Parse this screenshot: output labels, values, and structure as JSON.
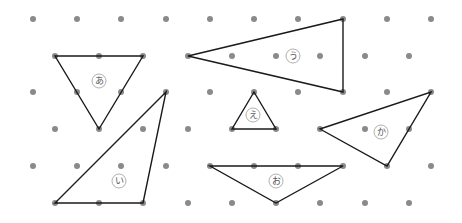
{
  "diagram": {
    "type": "triangular-dot-grid",
    "width": 462,
    "height": 223,
    "colors": {
      "dot": "#8a8a8a",
      "line": "#1a1a1a",
      "label_circle": "#9a9a9a",
      "label_text": "#555555"
    },
    "grid": {
      "rows": [
        {
          "y": 19,
          "xs": [
            33,
            77,
            121,
            166,
            210,
            254,
            298,
            343,
            387,
            431
          ]
        },
        {
          "y": 56,
          "xs": [
            55,
            99,
            143,
            188,
            232,
            276,
            320,
            365,
            409
          ]
        },
        {
          "y": 92,
          "xs": [
            33,
            77,
            121,
            166,
            210,
            254,
            298,
            343,
            387,
            431
          ]
        },
        {
          "y": 129,
          "xs": [
            55,
            99,
            143,
            188,
            232,
            276,
            320,
            365,
            409
          ]
        },
        {
          "y": 166,
          "xs": [
            33,
            77,
            121,
            166,
            210,
            254,
            298,
            343,
            387,
            431
          ]
        },
        {
          "y": 203,
          "xs": [
            55,
            99,
            143,
            188,
            232,
            276,
            320,
            365,
            409
          ]
        }
      ]
    },
    "triangles": [
      {
        "label": "あ",
        "points": [
          [
            55,
            56
          ],
          [
            143,
            56
          ],
          [
            99,
            129
          ]
        ],
        "label_pos": [
          99,
          81
        ]
      },
      {
        "label": "い",
        "points": [
          [
            166,
            92
          ],
          [
            55,
            203
          ],
          [
            143,
            203
          ]
        ],
        "label_pos": [
          119,
          181
        ]
      },
      {
        "label": "う",
        "points": [
          [
            188,
            56
          ],
          [
            343,
            19
          ],
          [
            343,
            92
          ]
        ],
        "label_pos": [
          293,
          56
        ]
      },
      {
        "label": "え",
        "points": [
          [
            254,
            92
          ],
          [
            232,
            129
          ],
          [
            276,
            129
          ]
        ],
        "label_pos": [
          253,
          115
        ]
      },
      {
        "label": "お",
        "points": [
          [
            210,
            166
          ],
          [
            343,
            166
          ],
          [
            276,
            203
          ]
        ],
        "label_pos": [
          276,
          181
        ]
      },
      {
        "label": "か",
        "points": [
          [
            320,
            129
          ],
          [
            431,
            92
          ],
          [
            387,
            166
          ]
        ],
        "label_pos": [
          381,
          132
        ]
      }
    ]
  }
}
